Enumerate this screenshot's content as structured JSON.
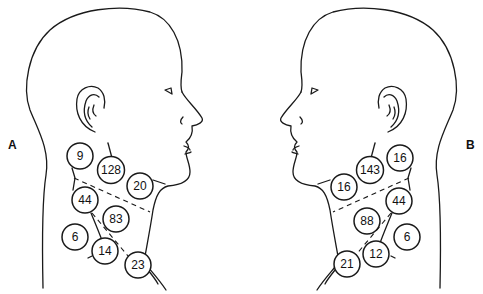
{
  "panels": [
    {
      "label": "A",
      "facing": "right",
      "nodes": [
        {
          "value": "9",
          "cx": 80,
          "cy": 156
        },
        {
          "value": "128",
          "cx": 111,
          "cy": 170
        },
        {
          "value": "20",
          "cx": 140,
          "cy": 186
        },
        {
          "value": "44",
          "cx": 85,
          "cy": 200
        },
        {
          "value": "83",
          "cx": 116,
          "cy": 219
        },
        {
          "value": "6",
          "cx": 75,
          "cy": 237
        },
        {
          "value": "14",
          "cx": 105,
          "cy": 251
        },
        {
          "value": "23",
          "cx": 138,
          "cy": 265
        }
      ]
    },
    {
      "label": "B",
      "facing": "left",
      "nodes": [
        {
          "value": "16",
          "cx": 400,
          "cy": 158
        },
        {
          "value": "143",
          "cx": 370,
          "cy": 170
        },
        {
          "value": "16",
          "cx": 344,
          "cy": 187
        },
        {
          "value": "44",
          "cx": 399,
          "cy": 201
        },
        {
          "value": "88",
          "cx": 367,
          "cy": 221
        },
        {
          "value": "6",
          "cx": 407,
          "cy": 237
        },
        {
          "value": "12",
          "cx": 376,
          "cy": 254
        },
        {
          "value": "21",
          "cx": 347,
          "cy": 264
        }
      ]
    }
  ],
  "colors": {
    "line": "#1a1a1a",
    "background": "#ffffff"
  }
}
